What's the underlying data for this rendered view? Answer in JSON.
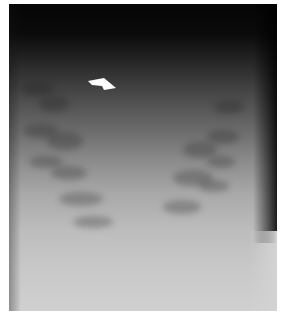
{
  "figure": {
    "type": "radiograph",
    "annotation": {
      "kind": "arrow",
      "color": "#ffffff",
      "direction": "pointing-down-right"
    },
    "colors": {
      "top": "#050505",
      "middle": "#8e8e8e",
      "bottom": "#d0d0d0",
      "frame_bg": "#ffffff"
    }
  },
  "caption": {
    "text": "",
    "truncated": true
  }
}
